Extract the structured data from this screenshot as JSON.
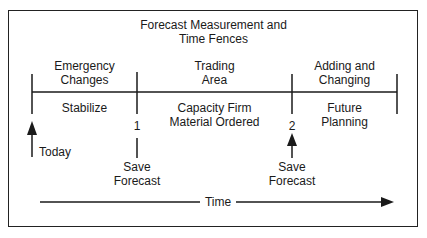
{
  "title": {
    "line1": "Forecast Measurement and",
    "line2": "Time Fences"
  },
  "zones": [
    {
      "top1": "Emergency",
      "top2": "Changes",
      "bottom1": "Stabilize",
      "bottom2": ""
    },
    {
      "top1": "Trading",
      "top2": "Area",
      "bottom1": "Capacity Firm",
      "bottom2": "Material Ordered"
    },
    {
      "top1": "Adding and",
      "top2": "Changing",
      "bottom1": "Future",
      "bottom2": "Planning"
    }
  ],
  "markers": {
    "today": "Today",
    "fence1": {
      "number": "1",
      "label1": "Save",
      "label2": "Forecast"
    },
    "fence2": {
      "number": "2",
      "label1": "Save",
      "label2": "Forecast"
    }
  },
  "axis": {
    "label": "Time"
  }
}
